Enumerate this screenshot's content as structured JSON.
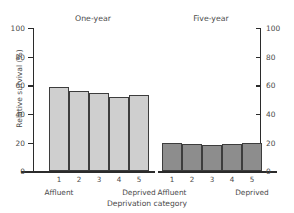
{
  "chart_data": {
    "type": "bar",
    "title": "",
    "xlabel": "Deprivation category",
    "ylabel": "Relative survival (%)",
    "ylim": [
      0,
      100
    ],
    "yticks": [
      0,
      20,
      40,
      60,
      80,
      100
    ],
    "ytick_labels": [
      "0",
      "20",
      "40",
      "60",
      "80",
      "100"
    ],
    "grid": false,
    "legend": "none",
    "dual_axis": true,
    "right_axis": {
      "ylim": [
        0,
        100
      ],
      "yticks": [
        0,
        20,
        40,
        60,
        80,
        100
      ],
      "ytick_labels": [
        "0",
        "20",
        "40",
        "60",
        "80",
        "100"
      ]
    },
    "categories": [
      "1",
      "2",
      "3",
      "4",
      "5"
    ],
    "category_end_labels": {
      "low": "Affluent",
      "high": "Deprived"
    },
    "groups": [
      {
        "name": "One-year",
        "color": "#cfcfcf",
        "categories": [
          "1",
          "2",
          "3",
          "4",
          "5"
        ],
        "values": [
          59,
          56,
          55,
          52,
          53.5
        ]
      },
      {
        "name": "Five-year",
        "color": "#8d8d8d",
        "categories": [
          "1",
          "2",
          "3",
          "4",
          "5"
        ],
        "values": [
          19.5,
          19,
          18.5,
          19,
          19.5
        ]
      }
    ]
  },
  "axes": {
    "ylabel": "Relative survival (%)",
    "xlabel": "Deprivation category",
    "ytick_labels": [
      "100",
      "80",
      "60",
      "40",
      "20",
      "0"
    ],
    "ytick_labels_right": [
      "100",
      "80",
      "60",
      "40",
      "20",
      "0"
    ]
  },
  "groups": {
    "one_year_title": "One-year",
    "five_year_title": "Five-year"
  },
  "category_labels": {
    "c1": "1",
    "c2": "2",
    "c3": "3",
    "c4": "4",
    "c5": "5",
    "affluent": "Affluent",
    "deprived": "Deprived"
  },
  "colors": {
    "one_year_fill": "#cfcfcf",
    "five_year_fill": "#8d8d8d",
    "bar_stroke": "#3d3d3d",
    "axis": "#2b2b2b",
    "text": "#4a4a4a",
    "background": "#ffffff"
  }
}
